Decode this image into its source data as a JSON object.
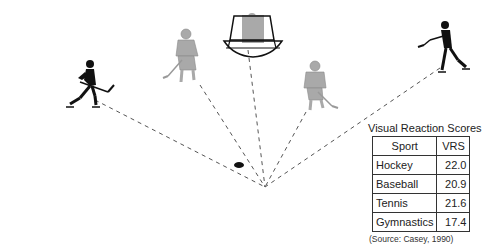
{
  "diagram": {
    "focal_point": {
      "x": 265,
      "y": 187
    },
    "puck": {
      "x": 239,
      "y": 165
    },
    "figures": [
      {
        "name": "left-skater",
        "style": "black-silhouette",
        "x": 85,
        "y": 85
      },
      {
        "name": "left-center-skater",
        "style": "gray",
        "x": 185,
        "y": 55
      },
      {
        "name": "goalie-in-net",
        "style": "gray",
        "x": 250,
        "y": 25
      },
      {
        "name": "right-center-skater",
        "style": "gray",
        "x": 312,
        "y": 85
      },
      {
        "name": "right-skater",
        "style": "black-silhouette",
        "x": 450,
        "y": 45
      }
    ],
    "colors": {
      "line": "#555555",
      "silhouette": "#111111",
      "gray_figure": "#a9a9a9"
    }
  },
  "table": {
    "title": "Visual Reaction Scores",
    "headers": [
      "Sport",
      "VRS"
    ],
    "rows": [
      {
        "sport": "Hockey",
        "vrs": "22.0"
      },
      {
        "sport": "Baseball",
        "vrs": "20.9"
      },
      {
        "sport": "Tennis",
        "vrs": "21.6"
      },
      {
        "sport": "Gymnastics",
        "vrs": "17.4"
      }
    ],
    "source": "(Source: Casey, 1990)"
  }
}
